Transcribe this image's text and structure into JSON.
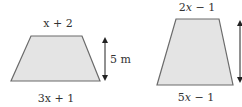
{
  "colors": {
    "fill": "#e4e4e4",
    "stroke": "#6b6b6b",
    "text": "#333333",
    "arrow": "#222222"
  },
  "left_trapezoid": {
    "top_label": "x + 2",
    "bottom_label": "3x + 1",
    "height_label": "5 m"
  },
  "right_trapezoid": {
    "top_label_coef": "2",
    "top_label_var": "x",
    "top_label_rest": " − 1",
    "bottom_label_coef": "5",
    "bottom_label_var": "x",
    "bottom_label_rest": " − 1"
  }
}
